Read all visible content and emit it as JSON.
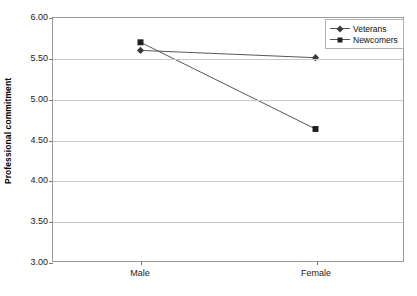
{
  "chart_data": {
    "type": "line",
    "title": "",
    "xlabel": "",
    "ylabel": "Professional commitment",
    "categories": [
      "Male",
      "Female"
    ],
    "ylim": [
      3.0,
      6.0
    ],
    "ytick_step": 0.5,
    "yticks": [
      "6.00",
      "5.50",
      "5.00",
      "4.50",
      "4.00",
      "3.50",
      "3.00"
    ],
    "ytick_values": [
      6.0,
      5.5,
      5.0,
      4.5,
      4.0,
      3.5,
      3.0
    ],
    "grid": true,
    "legend_position": "top-right",
    "series": [
      {
        "name": "Veterans",
        "marker": "diamond",
        "color": "#3b3b3b",
        "values": [
          5.6,
          5.51
        ]
      },
      {
        "name": "Newcomers",
        "marker": "square",
        "color": "#1f1f1f",
        "values": [
          5.7,
          4.63
        ]
      }
    ]
  },
  "legend": {
    "items": [
      {
        "label": "Veterans",
        "marker": "diamond-marker-icon"
      },
      {
        "label": "Newcomers",
        "marker": "square-marker-icon"
      }
    ]
  },
  "axes": {
    "y_title": "Professional commitment",
    "y_labels": [
      "6.00",
      "5.50",
      "5.00",
      "4.50",
      "4.00",
      "3.50",
      "3.00"
    ],
    "x_labels": [
      "Male",
      "Female"
    ]
  }
}
